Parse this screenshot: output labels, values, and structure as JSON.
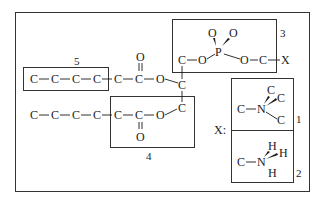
{
  "diagram": {
    "type": "structural-formula",
    "colors": {
      "ink": "#1a1a1a",
      "frame": "#333333",
      "background": "#ffffff"
    },
    "atoms": {
      "top_chain": [
        "C",
        "C",
        "C",
        "C",
        "C",
        "C",
        "O"
      ],
      "top_carbonyl_O": "O",
      "bottom_chain": [
        "C",
        "C",
        "C",
        "C",
        "C",
        "C",
        "O"
      ],
      "bottom_carbonyl_O": "O",
      "glycerol": [
        "C",
        "C",
        "C"
      ],
      "phosphate": {
        "P": "P",
        "O_top_left": "O",
        "O_top_right": "O",
        "O_left": "O",
        "O_right": "O",
        "C_left": "C",
        "C_right": "C",
        "X": "X"
      },
      "group1": {
        "C_left": "C",
        "N": "N",
        "C_a": "C",
        "C_b": "C",
        "C_c": "C"
      },
      "group2": {
        "C_left": "C",
        "N": "N",
        "H_a": "H",
        "H_b": "H",
        "H_c": "H"
      }
    },
    "labels": {
      "box5": "5",
      "box3": "3",
      "box4": "4",
      "box1": "1",
      "box2": "2",
      "x_key": "X:"
    }
  }
}
